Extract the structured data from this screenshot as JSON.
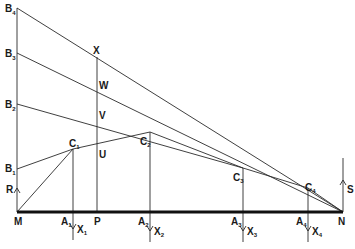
{
  "diagram": {
    "colors": {
      "line": "#2a2a2a",
      "baseline": "#111111",
      "background": "#ffffff"
    },
    "labels": {
      "B4": {
        "main": "B",
        "sub": "4"
      },
      "B3": {
        "main": "B",
        "sub": "3"
      },
      "B2": {
        "main": "B",
        "sub": "2"
      },
      "B1": {
        "main": "B",
        "sub": "1"
      },
      "R": {
        "main": "R"
      },
      "M": {
        "main": "M"
      },
      "N": {
        "main": "N"
      },
      "P": {
        "main": "P"
      },
      "S": {
        "main": "S"
      },
      "X": {
        "main": "X"
      },
      "W": {
        "main": "W"
      },
      "V": {
        "main": "V"
      },
      "U": {
        "main": "U"
      },
      "C1": {
        "main": "C",
        "sub": "1"
      },
      "C2": {
        "main": "C",
        "sub": "2"
      },
      "C3": {
        "main": "C",
        "sub": "3"
      },
      "C4": {
        "main": "C",
        "sub": "4"
      },
      "A1": {
        "main": "A",
        "sub": "1"
      },
      "A2": {
        "main": "A",
        "sub": "2"
      },
      "A3": {
        "main": "A",
        "sub": "3"
      },
      "A4": {
        "main": "A",
        "sub": "4"
      },
      "X1": {
        "main": "X",
        "sub": "1"
      },
      "X2": {
        "main": "X",
        "sub": "2"
      },
      "X3": {
        "main": "X",
        "sub": "3"
      },
      "X4": {
        "main": "X",
        "sub": "4"
      }
    },
    "points": {
      "M": [
        17,
        212
      ],
      "N": [
        343,
        212
      ],
      "B4": [
        17,
        8
      ],
      "B3": [
        17,
        53
      ],
      "B2": [
        17,
        104
      ],
      "B1": [
        17,
        169
      ],
      "C1": [
        73,
        149
      ],
      "C2": [
        150,
        132
      ],
      "C3": [
        243,
        168
      ],
      "C4": [
        308,
        188
      ],
      "X": [
        97,
        57
      ],
      "W": [
        97,
        88
      ],
      "V": [
        97,
        118
      ],
      "U": [
        97,
        147
      ],
      "P": [
        97,
        212
      ]
    }
  }
}
